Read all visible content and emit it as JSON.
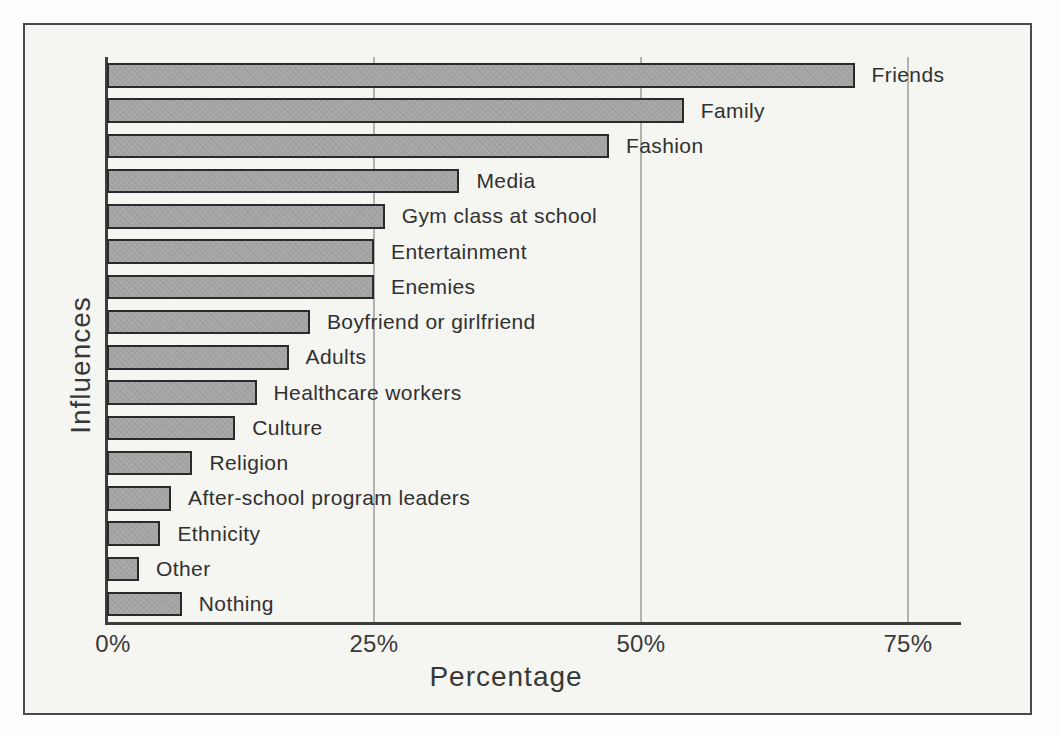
{
  "chart_data": {
    "type": "bar",
    "orientation": "horizontal",
    "title": "",
    "xlabel": "Percentage",
    "ylabel": "Influences",
    "categories": [
      "Friends",
      "Family",
      "Fashion",
      "Media",
      "Gym class at school",
      "Entertainment",
      "Enemies",
      "Boyfriend or girlfriend",
      "Adults",
      "Healthcare workers",
      "Culture",
      "Religion",
      "After-school program leaders",
      "Ethnicity",
      "Other",
      "Nothing"
    ],
    "values": [
      70,
      54,
      47,
      33,
      26,
      25,
      25,
      19,
      17,
      14,
      12,
      8,
      6,
      5,
      3,
      7
    ],
    "value_unit": "%",
    "xlim": [
      0,
      80
    ],
    "x_ticks": [
      {
        "value": 0,
        "label": "0%"
      },
      {
        "value": 25,
        "label": "25%"
      },
      {
        "value": 50,
        "label": "50%"
      },
      {
        "value": 75,
        "label": "75%"
      }
    ],
    "grid": "vertical-only",
    "legend": "none",
    "colors": {
      "bar_fill": "#a6a6a6",
      "bar_border": "#2a2a2a",
      "axis": "#3d3d3d",
      "gridline": "#b2b2af",
      "text": "#303030",
      "plot_background": "#f5f5f2",
      "frame_border": "#4a4a4a",
      "page_background": "#fdfdfc"
    }
  }
}
